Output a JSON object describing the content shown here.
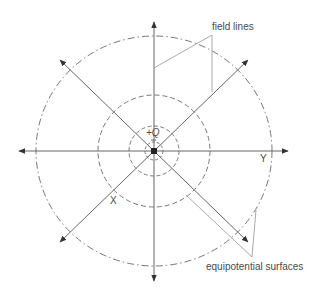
{
  "diagram": {
    "charge_label": "+Q",
    "axis_x_label": "X",
    "axis_y_label": "Y",
    "callouts": {
      "field_lines": "field lines",
      "equipotential": "equipotential surfaces"
    },
    "colors": {
      "line": "#666666",
      "arrow": "#333333",
      "leader": "#aaaaaa",
      "text": "#4a4a4a"
    },
    "center": [
      154,
      151
    ],
    "equipotential_radii": [
      9,
      25,
      56,
      117
    ]
  }
}
